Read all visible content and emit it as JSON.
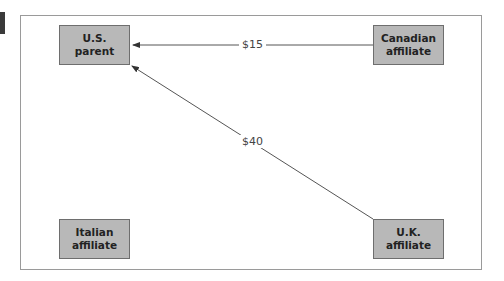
{
  "diagram": {
    "nodes": {
      "us_parent": {
        "line1": "U.S.",
        "line2": "parent"
      },
      "canadian_affiliate": {
        "line1": "Canadian",
        "line2": "affiliate"
      },
      "italian_affiliate": {
        "line1": "Italian",
        "line2": "affiliate"
      },
      "uk_affiliate": {
        "line1": "U.K.",
        "line2": "affiliate"
      }
    },
    "flows": [
      {
        "from": "Canadian affiliate",
        "to": "U.S. parent",
        "amount": "$15"
      },
      {
        "from": "U.K. affiliate",
        "to": "U.S. parent",
        "amount": "$40"
      }
    ],
    "colors": {
      "node_fill": "#b8b8b8",
      "node_border": "#6e6e6e",
      "arrow": "#555555",
      "frame": "#9a9a9a"
    }
  }
}
